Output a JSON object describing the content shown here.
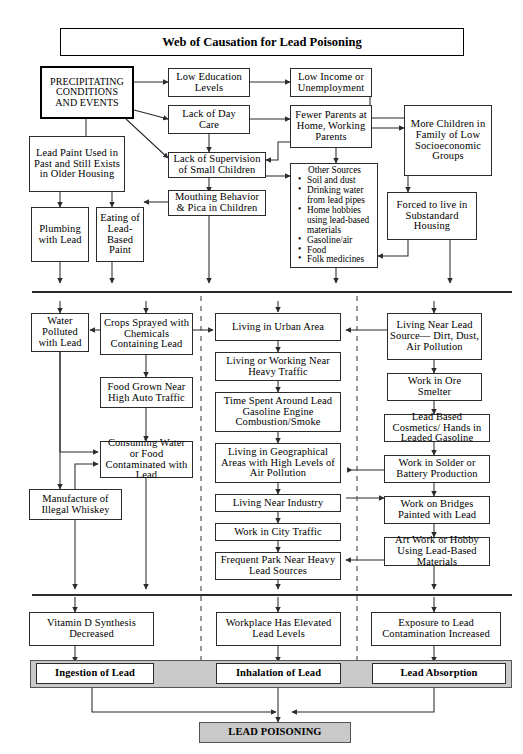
{
  "title": "Web of Causation for Lead Poisoning",
  "nodes": {
    "precipitating": "PRECIPITATING CONDITIONS AND EVENTS",
    "low_education": "Low Education Levels",
    "low_income": "Low Income or Unemployment",
    "lack_day_care": "Lack of Day Care",
    "fewer_parents": "Fewer Parents at Home, Working Parents",
    "more_children": "More Children in Family of Low Socioeconomic Groups",
    "lead_paint": "Lead Paint Used in Past and Still Exists in Older Housing",
    "lack_supervision": "Lack of Supervision of Small Children",
    "forced_substandard": "Forced to live in Substandard Housing",
    "mouthing": "Mouthing Behavior & Pica in Children",
    "plumbing": "Plumbing with Lead",
    "eating_paint": "Eating of Lead-Based Paint",
    "other_sources_heading": "Other Sources",
    "other_sources_items": [
      "Soil and dust",
      "Drinking water from lead pipes",
      "Home hobbies using lead-based materials",
      "Gasoline/air",
      "Food",
      "Folk medicines"
    ],
    "water_polluted": "Water Polluted with Lead",
    "crops_sprayed": "Crops Sprayed with Chemicals Containing Lead",
    "living_urban": "Living in Urban Area",
    "living_lead_source": "Living Near Lead Source— Dirt, Dust, Air Pollution",
    "living_heavy_traffic": "Living or Working Near Heavy Traffic",
    "food_grown": "Food Grown Near High Auto Traffic",
    "time_spent_gasoline": "Time Spent Around Lead Gasoline Engine Combustion/Smoke",
    "work_ore_smelter": "Work in Ore Smelter",
    "consuming_water": "Consuming Water or Food Contaminated with Lead",
    "living_geographical": "Living in Geographical Areas with High Levels of Air Pollution",
    "lead_cosmetics": "Lead Based Cosmetics/ Hands in Leaded Gasoline",
    "work_solder": "Work in Solder or Battery Production",
    "manufacture_whiskey": "Manufacture of Illegal Whiskey",
    "living_industry": "Living Near Industry",
    "work_bridges": "Work on Bridges Painted with Lead",
    "work_city_traffic": "Work in City Traffic",
    "art_work_hobby": "Art Work or Hobby Using Lead-Based Materials",
    "frequent_park": "Frequent Park Near Heavy Lead Sources",
    "vitamin_d": "Vitamin D Synthesis Decreased",
    "workplace_elevated": "Workplace Has Elevated Lead Levels",
    "exposure_increased": "Exposure to Lead Contamination Increased",
    "ingestion": "Ingestion of Lead",
    "inhalation": "Inhalation of Lead",
    "absorption": "Lead Absorption",
    "lead_poisoning": "LEAD POISONING"
  },
  "colors": {
    "band_fill": "#c9c9c9",
    "line": "#2b2b2b",
    "background": "#ffffff"
  }
}
